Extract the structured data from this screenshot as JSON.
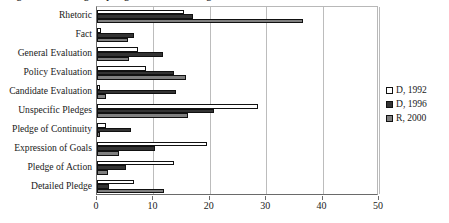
{
  "chart_data": {
    "type": "bar",
    "orientation": "horizontal",
    "title": "Figure 1. Percentage of pledge and rhetoric categories",
    "xlabel": "",
    "ylabel": "",
    "xlim": [
      0,
      50
    ],
    "xticks": [
      0,
      10,
      20,
      30,
      40,
      50
    ],
    "grid": true,
    "legend_position": "right",
    "categories": [
      "Rhetoric",
      "Fact",
      "General Evaluation",
      "Policy Evaluation",
      "Candidate Evaluation",
      "Unspecific Pledges",
      "Pledge of Continuity",
      "Expression of Goals",
      "Pledge of Action",
      "Detailed Pledge"
    ],
    "series": [
      {
        "name": "D, 1992",
        "color": "#ffffff",
        "values": [
          15.5,
          0.7,
          7.3,
          8.7,
          0.5,
          28.6,
          1.6,
          19.5,
          13.7,
          6.5
        ]
      },
      {
        "name": "D, 1996",
        "color": "#333333",
        "values": [
          17.0,
          6.6,
          11.7,
          13.7,
          14.0,
          20.8,
          6.0,
          10.2,
          5.2,
          2.2
        ]
      },
      {
        "name": "R, 2000",
        "color": "#808080",
        "values": [
          36.6,
          5.5,
          5.7,
          15.8,
          1.6,
          16.2,
          0.5,
          3.9,
          1.9,
          11.9
        ]
      }
    ]
  },
  "legend": {
    "items": [
      {
        "label": "D, 1992"
      },
      {
        "label": "D, 1996"
      },
      {
        "label": "R, 2000"
      }
    ]
  }
}
